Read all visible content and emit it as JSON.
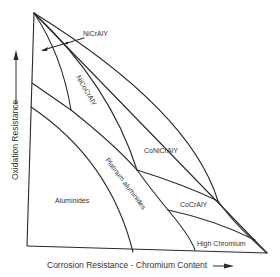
{
  "diagram": {
    "type": "coating-regime-map",
    "x_axis_label": "Corrosion Resistance - Chromium Content",
    "y_axis_label": "Oxidation Resistance",
    "regions": [
      {
        "id": "nicraly",
        "label": "NiCrAlY"
      },
      {
        "id": "nicocraly",
        "label": "NiCoCrAlY"
      },
      {
        "id": "conicraly",
        "label": "CoNiCrAlY"
      },
      {
        "id": "platinum-aluminides",
        "label": "Platinum aluminides"
      },
      {
        "id": "aluminides",
        "label": "Aluminides"
      },
      {
        "id": "cocraly",
        "label": "CoCrAlY"
      },
      {
        "id": "high-chromium",
        "label": "High Chromium"
      }
    ],
    "colors": {
      "line": "#2a2a2a",
      "text": "#333333",
      "background": "#ffffff"
    }
  }
}
